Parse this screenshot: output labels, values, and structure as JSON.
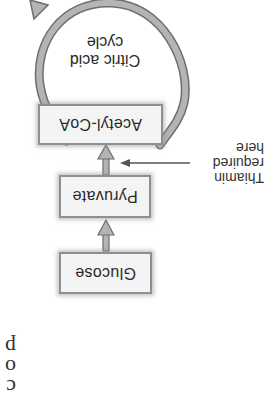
{
  "diagram": {
    "orientation": "rotated 180 degrees",
    "nodes": [
      {
        "id": "glucose",
        "label": "Glucose"
      },
      {
        "id": "pyruvate",
        "label": "Pyruvate"
      },
      {
        "id": "acetyl_coa",
        "label": "Acetyl-CoA"
      }
    ],
    "cycle": {
      "label_line1": "Citric acid",
      "label_line2": "cycle"
    },
    "annotation": {
      "line1": "Thiamin",
      "line2": "required",
      "line3": "here"
    },
    "edges": [
      {
        "from": "glucose",
        "to": "pyruvate"
      },
      {
        "from": "pyruvate",
        "to": "acetyl_coa"
      },
      {
        "from": "acetyl_coa",
        "to": "citric_acid_cycle"
      }
    ],
    "page_fragments": [
      "p",
      "o",
      "c"
    ],
    "colors": {
      "box_fill": "#f4f4f4",
      "box_border": "#8f8f8f",
      "arrow_fill": "#a8a8a8",
      "arrow_stroke": "#6e6e6e",
      "text": "#2a2a2a"
    }
  }
}
